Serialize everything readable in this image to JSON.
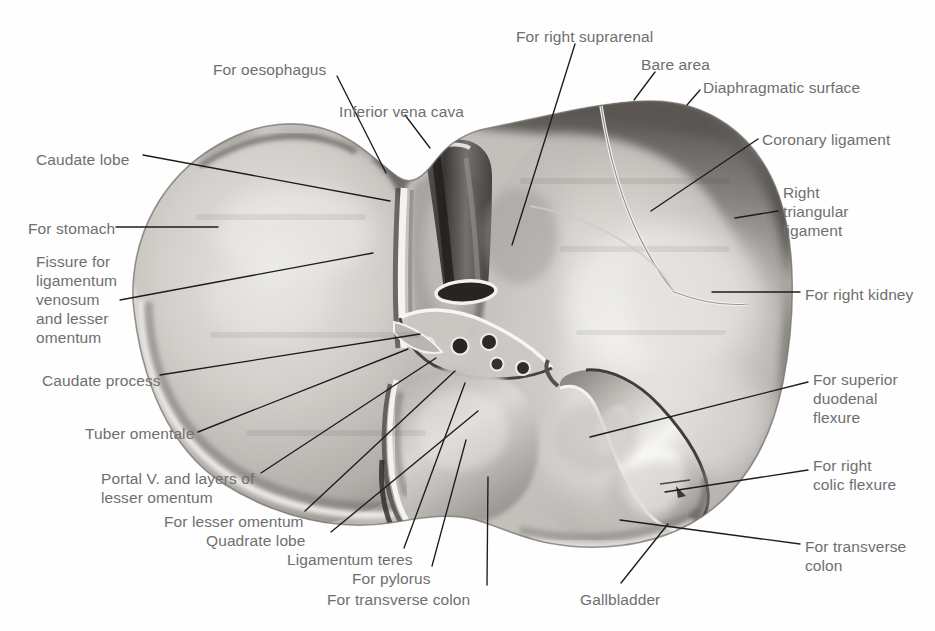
{
  "figure": {
    "style": "grayscale halftone photograph with leader lines",
    "background_color": "#ffffff",
    "label_text_color": "#6f6f6f",
    "leader_line_color": "#1c1c1c"
  },
  "labels": [
    {
      "id": "for-oesophagus",
      "text": "For oesophagus",
      "x": 213,
      "y": 60,
      "align": "left"
    },
    {
      "id": "for-right-suprarenal",
      "text": "For right suprarenal",
      "x": 516,
      "y": 27,
      "align": "left"
    },
    {
      "id": "bare-area",
      "text": "Bare area",
      "x": 641,
      "y": 55,
      "align": "left"
    },
    {
      "id": "diaphragmatic-surface",
      "text": "Diaphragmatic surface",
      "x": 703,
      "y": 78,
      "align": "left"
    },
    {
      "id": "inferior-vena-cava",
      "text": "Inferior vena cava",
      "x": 339,
      "y": 102,
      "align": "left"
    },
    {
      "id": "coronary-ligament",
      "text": "Coronary ligament",
      "x": 762,
      "y": 130,
      "align": "left"
    },
    {
      "id": "caudate-lobe",
      "text": "Caudate lobe",
      "x": 36,
      "y": 150,
      "align": "left"
    },
    {
      "id": "right-triangular-ligament",
      "text": "Right\ntriangular\nligament",
      "x": 783,
      "y": 183,
      "align": "left"
    },
    {
      "id": "for-stomach",
      "text": "For stomach",
      "x": 28,
      "y": 219,
      "align": "left"
    },
    {
      "id": "fissure-ligamentum-venosum",
      "text": "Fissure for\nligamentum\nvenosum\nand lesser\nomentum",
      "x": 36,
      "y": 252,
      "align": "left"
    },
    {
      "id": "for-right-kidney",
      "text": "For right kidney",
      "x": 805,
      "y": 285,
      "align": "left"
    },
    {
      "id": "caudate-process",
      "text": "Caudate process",
      "x": 42,
      "y": 371,
      "align": "left"
    },
    {
      "id": "for-superior-duodenal-flexure",
      "text": "For superior\nduodenal\nflexure",
      "x": 813,
      "y": 370,
      "align": "left"
    },
    {
      "id": "tuber-omentale",
      "text": "Tuber omentale",
      "x": 85,
      "y": 424,
      "align": "left"
    },
    {
      "id": "for-right-colic-flexure",
      "text": "For right\ncolic flexure",
      "x": 813,
      "y": 456,
      "align": "left"
    },
    {
      "id": "portal-v-and-layers",
      "text": "Portal V. and layers of\nlesser omentum",
      "x": 101,
      "y": 469,
      "align": "left"
    },
    {
      "id": "for-lesser-omentum",
      "text": "For lesser omentum",
      "x": 164,
      "y": 512,
      "align": "left"
    },
    {
      "id": "quadrate-lobe",
      "text": "Quadrate lobe",
      "x": 206,
      "y": 531,
      "align": "left"
    },
    {
      "id": "for-transverse-colon-right",
      "text": "For transverse\ncolon",
      "x": 805,
      "y": 537,
      "align": "left"
    },
    {
      "id": "ligamentum-teres",
      "text": "Ligamentum teres",
      "x": 287,
      "y": 550,
      "align": "left"
    },
    {
      "id": "for-pylorus",
      "text": "For pylorus",
      "x": 352,
      "y": 569,
      "align": "left"
    },
    {
      "id": "for-transverse-colon-bottom",
      "text": "For transverse colon",
      "x": 327,
      "y": 590,
      "align": "left"
    },
    {
      "id": "gallbladder",
      "text": "Gallbladder",
      "x": 580,
      "y": 590,
      "align": "left"
    }
  ],
  "leaders": [
    {
      "id": "leader-for-oesophagus",
      "d": "M 337 76 L 386 173"
    },
    {
      "id": "leader-for-right-suprarenal",
      "d": "M 575 44 L 512 245"
    },
    {
      "id": "leader-bare-area",
      "d": "M 655 72 L 634 100"
    },
    {
      "id": "leader-diaphragmatic-surface",
      "d": "M 700 90 L 687 105"
    },
    {
      "id": "leader-inferior-vena-cava",
      "d": "M 405 115 L 430 148"
    },
    {
      "id": "leader-coronary-ligament",
      "d": "M 758 139 L 651 211"
    },
    {
      "id": "leader-caudate-lobe",
      "d": "M 143 155 L 390 201"
    },
    {
      "id": "leader-right-triangular-ligament",
      "d": "M 778 211 L 735 218"
    },
    {
      "id": "leader-for-stomach",
      "d": "M 116 227 L 218 227"
    },
    {
      "id": "leader-fissure-ligamentum-venosum",
      "d": "M 120 300 L 373 253"
    },
    {
      "id": "leader-for-right-kidney",
      "d": "M 800 292 L 712 292"
    },
    {
      "id": "leader-caudate-process",
      "d": "M 160 375 L 420 334"
    },
    {
      "id": "leader-for-superior-duodenal-flexure",
      "d": "M 808 382 L 590 437"
    },
    {
      "id": "leader-tuber-omentale",
      "d": "M 198 432 L 408 349"
    },
    {
      "id": "leader-for-right-colic-flexure",
      "d": "M 808 470 L 665 492"
    },
    {
      "id": "leader-portal-v-and-layers",
      "d": "M 261 473 L 436 358"
    },
    {
      "id": "leader-for-lesser-omentum",
      "d": "M 305 511 L 455 371"
    },
    {
      "id": "leader-quadrate-lobe",
      "d": "M 331 532 L 478 411"
    },
    {
      "id": "leader-for-transverse-colon-right",
      "d": "M 800 544 L 620 520"
    },
    {
      "id": "leader-ligamentum-teres",
      "d": "M 404 548 L 465 383"
    },
    {
      "id": "leader-for-pylorus",
      "d": "M 432 566 L 466 440"
    },
    {
      "id": "leader-for-transverse-colon-bottom",
      "d": "M 487 585 L 488 477"
    },
    {
      "id": "leader-gallbladder",
      "d": "M 621 583 L 668 524"
    }
  ],
  "structures": [
    {
      "id": "left-lobe",
      "name": "Left lobe of liver"
    },
    {
      "id": "right-lobe",
      "name": "Right lobe of liver"
    },
    {
      "id": "caudate-lobe-shape",
      "name": "Caudate lobe"
    },
    {
      "id": "quadrate-lobe-shape",
      "name": "Quadrate lobe"
    },
    {
      "id": "gallbladder-shape",
      "name": "Gallbladder"
    },
    {
      "id": "ivc-groove",
      "name": "Groove for inferior vena cava"
    },
    {
      "id": "porta-hepatis",
      "name": "Porta hepatis with vessel openings"
    },
    {
      "id": "ligamentum-venosum-fissure",
      "name": "Fissure for ligamentum venosum"
    }
  ]
}
